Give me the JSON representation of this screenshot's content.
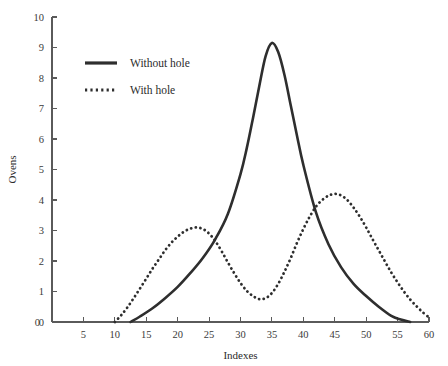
{
  "figure": {
    "background_color": "#ffffff",
    "ink_color": "#2e2e2e",
    "axis_color": "#5a5a5a"
  },
  "chart_data": {
    "type": "line",
    "title": "",
    "subtitle": "",
    "xlabel": "Indexes",
    "ylabel": "Ovens",
    "xlim": [
      0,
      60
    ],
    "ylim": [
      0,
      10
    ],
    "xticks": [
      0,
      5,
      10,
      15,
      20,
      25,
      30,
      35,
      40,
      45,
      50,
      55,
      60
    ],
    "yticks": [
      0,
      1,
      2,
      3,
      4,
      5,
      6,
      7,
      8,
      9,
      10
    ],
    "xtick_labels": [
      "0",
      "5",
      "10",
      "15",
      "20",
      "25",
      "30",
      "35",
      "40",
      "45",
      "50",
      "55",
      "60"
    ],
    "ytick_labels": [
      "0",
      "1",
      "2",
      "3",
      "4",
      "5",
      "6",
      "7",
      "8",
      "9",
      "10"
    ],
    "grid": false,
    "legend_position": "upper-left-inside",
    "spines": [
      "left",
      "bottom"
    ],
    "series": [
      {
        "name": "Without hole",
        "style": "solid",
        "color": "#2e2e2e",
        "peak_x": 35,
        "peak_y": 9.15,
        "x": [
          12.5,
          14,
          16,
          18,
          20,
          22,
          24,
          26,
          28,
          30,
          31,
          32,
          33,
          34,
          35,
          36,
          37,
          38,
          39,
          40,
          42,
          44,
          46,
          48,
          50,
          52,
          54,
          55.5,
          57
        ],
        "y": [
          0.0,
          0.18,
          0.45,
          0.78,
          1.15,
          1.6,
          2.1,
          2.72,
          3.55,
          4.85,
          5.7,
          6.7,
          7.75,
          8.72,
          9.15,
          8.85,
          8.1,
          7.1,
          6.1,
          5.15,
          3.6,
          2.55,
          1.8,
          1.25,
          0.85,
          0.5,
          0.2,
          0.08,
          0.0
        ]
      },
      {
        "name": "With hole",
        "style": "dotted",
        "color": "#2e2e2e",
        "peaks": [
          {
            "x": 23,
            "y": 3.1
          },
          {
            "x": 45,
            "y": 4.2
          }
        ],
        "trough": {
          "x": 33,
          "y": 0.75
        },
        "x": [
          10,
          11,
          12,
          13,
          14,
          15,
          16,
          17,
          18,
          19,
          20,
          21,
          22,
          23,
          24,
          25,
          26,
          27,
          28,
          29,
          30,
          31,
          32,
          33,
          34,
          35,
          36,
          37,
          38,
          39,
          40,
          41,
          42,
          43,
          44,
          45,
          46,
          47,
          48,
          49,
          50,
          51,
          52,
          53,
          54,
          55,
          56,
          57,
          58,
          59,
          60
        ],
        "y": [
          0.0,
          0.22,
          0.48,
          0.78,
          1.1,
          1.42,
          1.75,
          2.05,
          2.35,
          2.6,
          2.8,
          2.96,
          3.06,
          3.1,
          3.05,
          2.9,
          2.65,
          2.32,
          1.95,
          1.6,
          1.28,
          1.02,
          0.85,
          0.75,
          0.78,
          0.95,
          1.25,
          1.65,
          2.1,
          2.6,
          3.05,
          3.45,
          3.78,
          4.0,
          4.14,
          4.2,
          4.15,
          4.0,
          3.75,
          3.45,
          3.1,
          2.72,
          2.35,
          1.98,
          1.62,
          1.3,
          1.0,
          0.74,
          0.52,
          0.32,
          0.15
        ]
      }
    ],
    "legend_entries": [
      "Without hole",
      "With hole"
    ]
  }
}
